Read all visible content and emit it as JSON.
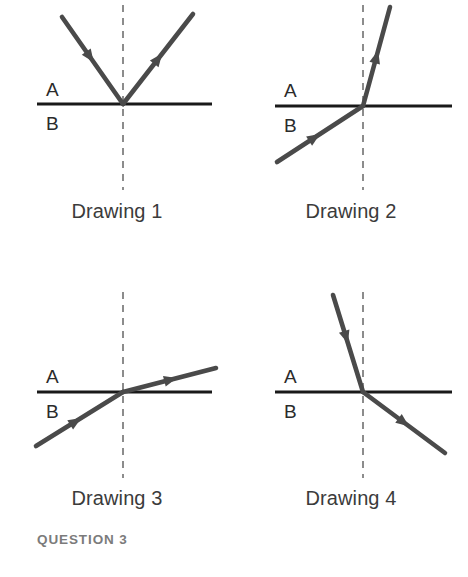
{
  "caption": "QUESTION 3",
  "colors": {
    "ray": "#4a4a4a",
    "interface": "#1a1a1a",
    "normal": "#8c8c8c",
    "label_text": "#2b2b2b",
    "drawing_label_text": "#3b3b3b",
    "caption_text": "#7b7b7b",
    "background": "#ffffff"
  },
  "media": {
    "upper": "A",
    "lower": "B"
  },
  "panels": [
    {
      "id": "drawing-1",
      "label": "Drawing 1",
      "phenomenon": "reflection",
      "origin_x": 123,
      "origin_y": 104,
      "interface_x1": 37,
      "interface_x2": 212,
      "normal_y1": 5,
      "normal_y2": 190,
      "upper_label_x": 46,
      "upper_label_y": 96,
      "lower_label_x": 46,
      "lower_label_y": 130,
      "label_y": 200,
      "rays": [
        {
          "name": "incident-ray",
          "x1": 62,
          "y1": 17,
          "x2": 123,
          "y2": 104,
          "arrow_t": 0.52,
          "direction": "forward"
        },
        {
          "name": "reflected-ray",
          "x1": 123,
          "y1": 104,
          "x2": 193,
          "y2": 14,
          "arrow_t": 0.56,
          "direction": "forward"
        }
      ]
    },
    {
      "id": "drawing-2",
      "label": "Drawing 2",
      "phenomenon": "refraction-toward-normal",
      "origin_x": 129,
      "origin_y": 106,
      "interface_x1": 41,
      "interface_x2": 218,
      "normal_y1": 5,
      "normal_y2": 190,
      "upper_label_x": 50,
      "upper_label_y": 97,
      "lower_label_x": 50,
      "lower_label_y": 132,
      "label_y": 200,
      "rays": [
        {
          "name": "incident-ray",
          "x1": 43,
          "y1": 162,
          "x2": 129,
          "y2": 106,
          "arrow_t": 0.5,
          "direction": "forward"
        },
        {
          "name": "refracted-ray",
          "x1": 129,
          "y1": 106,
          "x2": 156,
          "y2": 7,
          "arrow_t": 0.56,
          "direction": "forward"
        }
      ]
    },
    {
      "id": "drawing-3",
      "label": "Drawing 3",
      "phenomenon": "refraction-away-from-normal",
      "origin_x": 123,
      "origin_y": 112,
      "interface_x1": 37,
      "interface_x2": 212,
      "normal_y1": 12,
      "normal_y2": 198,
      "upper_label_x": 46,
      "upper_label_y": 103,
      "lower_label_x": 46,
      "lower_label_y": 138,
      "label_y": 207,
      "rays": [
        {
          "name": "incident-ray",
          "x1": 36,
          "y1": 166,
          "x2": 123,
          "y2": 112,
          "arrow_t": 0.52,
          "direction": "forward"
        },
        {
          "name": "refracted-ray",
          "x1": 123,
          "y1": 112,
          "x2": 216,
          "y2": 88,
          "arrow_t": 0.58,
          "direction": "forward"
        }
      ]
    },
    {
      "id": "drawing-4",
      "label": "Drawing 4",
      "phenomenon": "refraction-away-from-normal",
      "origin_x": 129,
      "origin_y": 112,
      "interface_x1": 41,
      "interface_x2": 218,
      "normal_y1": 12,
      "normal_y2": 198,
      "upper_label_x": 50,
      "upper_label_y": 103,
      "lower_label_x": 50,
      "lower_label_y": 138,
      "label_y": 207,
      "rays": [
        {
          "name": "incident-ray",
          "x1": 99,
          "y1": 15,
          "x2": 129,
          "y2": 112,
          "arrow_t": 0.5,
          "direction": "forward"
        },
        {
          "name": "refracted-ray",
          "x1": 129,
          "y1": 112,
          "x2": 211,
          "y2": 173,
          "arrow_t": 0.56,
          "direction": "forward"
        }
      ]
    }
  ],
  "layout": {
    "panel_positions": [
      {
        "left": 0,
        "top": 0
      },
      {
        "left": 234,
        "top": 0
      },
      {
        "left": 0,
        "top": 280
      },
      {
        "left": 234,
        "top": 280
      }
    ],
    "ray_width": 4.6,
    "interface_width": 3.2,
    "normal_width": 2,
    "normal_dash": "7 6",
    "arrow_size": 13
  }
}
